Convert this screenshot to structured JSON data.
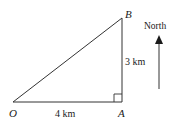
{
  "diagram": {
    "type": "right-triangle-bearing",
    "points": {
      "O": {
        "label": "O"
      },
      "A": {
        "label": "A"
      },
      "B": {
        "label": "B"
      }
    },
    "sides": {
      "OA": {
        "label": "4 km"
      },
      "AB": {
        "label": "3 km"
      }
    },
    "right_angle_at": "A",
    "compass": {
      "label": "North"
    },
    "colors": {
      "stroke": "#333333",
      "text": "#1a1a1a"
    }
  }
}
